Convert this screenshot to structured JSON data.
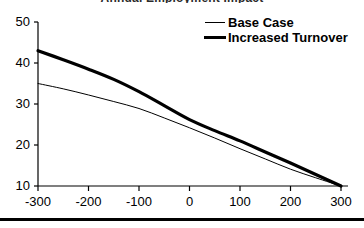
{
  "figure": {
    "title_remnant": "Annual Employment Impact",
    "bottom_rule": "horizontal-rule"
  },
  "legend": {
    "position": "top-right",
    "items": [
      {
        "label": "Base Case",
        "style": "thin-line",
        "color": "#000000"
      },
      {
        "label": "Increased Turnover",
        "style": "thick-line",
        "color": "#000000"
      }
    ]
  },
  "axes": {
    "y_ticks": [
      "50",
      "40",
      "30",
      "20",
      "10"
    ],
    "x_ticks": [
      "-300",
      "-200",
      "-100",
      "0",
      "100",
      "200",
      "300"
    ]
  },
  "chart_data": {
    "type": "line",
    "title": "",
    "xlabel": "",
    "ylabel": "",
    "xlim": [
      -300,
      300
    ],
    "ylim": [
      10,
      50
    ],
    "grid": false,
    "legend_position": "top-right",
    "x": [
      -300,
      -250,
      -200,
      -150,
      -100,
      -50,
      0,
      50,
      100,
      150,
      200,
      250,
      300
    ],
    "series": [
      {
        "name": "Base Case",
        "style": "thin-line",
        "color": "#000000",
        "values": [
          35.0,
          33.7,
          32.2,
          30.6,
          28.9,
          26.6,
          24.2,
          21.7,
          19.1,
          16.6,
          14.1,
          12.0,
          10.0
        ]
      },
      {
        "name": "Increased Turnover",
        "style": "thick-line",
        "color": "#000000",
        "values": [
          43.0,
          40.8,
          38.5,
          36.0,
          33.0,
          29.6,
          26.2,
          23.5,
          21.0,
          18.3,
          15.6,
          12.8,
          10.0
        ]
      }
    ]
  }
}
